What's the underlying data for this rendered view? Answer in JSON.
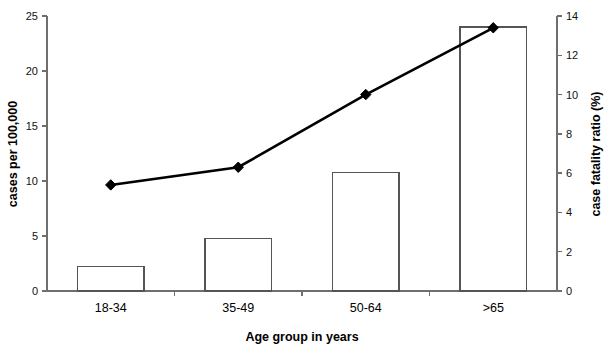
{
  "chart_data": {
    "type": "bar",
    "title": "",
    "subtitle": "",
    "categories": [
      "18-34",
      "35-49",
      "50-64",
      ">65"
    ],
    "xlabel": "Age group in years",
    "ylabel": "cases per 100,000",
    "y2label": "case fatality ratio (%)",
    "ylim": [
      0,
      25
    ],
    "y2lim": [
      0,
      14
    ],
    "yticks": [
      0,
      5,
      10,
      15,
      20,
      25
    ],
    "y2ticks": [
      0,
      2,
      4,
      6,
      8,
      10,
      12,
      14
    ],
    "ytick_labels": [
      "0",
      "5",
      "10",
      "15",
      "20",
      "25"
    ],
    "y2tick_labels": [
      "0",
      "2",
      "4",
      "6",
      "8",
      "10",
      "12",
      "14"
    ],
    "grid": false,
    "legend": "none",
    "series": [
      {
        "name": "cases per 100,000",
        "type": "bar",
        "axis": "left",
        "values": [
          2.2,
          4.8,
          10.8,
          24.0
        ]
      },
      {
        "name": "case fatality ratio (%)",
        "type": "line",
        "axis": "right",
        "marker": "diamond",
        "values": [
          5.4,
          6.3,
          10.0,
          13.4
        ]
      }
    ]
  },
  "axis_labels": {
    "left": "cases per 100,000",
    "right": "case fatality ratio (%)",
    "bottom": "Age group in years"
  }
}
